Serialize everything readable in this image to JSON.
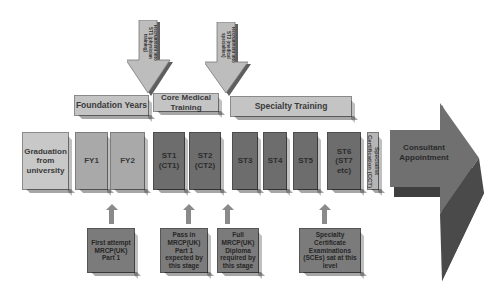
{
  "recruitment_arrows": [
    {
      "label": "Recruitment into ST1 (physician training)"
    },
    {
      "label": "Recruitment into ST3 (medical specialties)"
    }
  ],
  "stages": [
    {
      "label": "Foundation Years"
    },
    {
      "label": "Core Medical Training"
    },
    {
      "label": "Specialty Training"
    }
  ],
  "timeline": {
    "graduation": "Graduation from university",
    "fy1": "FY1",
    "fy2": "FY2",
    "st1": "ST1 (CT1)",
    "st2": "ST2 (CT2)",
    "st3": "ST3",
    "st4": "ST4",
    "st5": "ST5",
    "st6": "ST6 (ST7 etc)",
    "certification": "Specialist Certification (CCT)",
    "consultant": "Consultant Appointment"
  },
  "milestones": [
    {
      "label": "First attempt MRCP(UK) Part 1"
    },
    {
      "label": "Pass in MRCP(UK) Part 1 expected by this stage"
    },
    {
      "label": "Full MRCP(UK) Diploma required by this stage"
    },
    {
      "label": "Specialty Certificate Examinations (SCEs) sat at this level"
    }
  ],
  "colors": {
    "light": "#c8c8c8",
    "mid": "#a9a9a9",
    "dark": "#6d6d6d",
    "consultant": "#707070"
  }
}
